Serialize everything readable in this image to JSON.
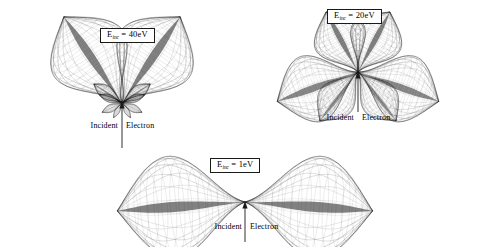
{
  "figure": {
    "background": "#ffffff",
    "ink": "#1a1a1a"
  },
  "chart_data": {
    "type": "line",
    "title": "",
    "xlabel": "",
    "ylabel": "",
    "plot_style": "polar wireframe surface of revolution",
    "panels": [
      {
        "id": "panel-40",
        "energy_label_prefix": "E",
        "energy_label_subscript": "inc",
        "energy_label_value": " = 40eV",
        "energy_ev": 40,
        "caption_left": "Incident",
        "caption_right": "Electron",
        "lobe_count": 10,
        "center_x": 122,
        "center_y": 103,
        "incident_arrow": {
          "from_y": 148,
          "to_y": 106
        },
        "lobes": [
          {
            "angle_deg": 124,
            "radius": 104,
            "width": 30,
            "weight": 1.0
          },
          {
            "angle_deg": 56,
            "radius": 104,
            "width": 30,
            "weight": 1.0
          },
          {
            "angle_deg": 146,
            "radius": 34,
            "width": 16,
            "weight": 0.75
          },
          {
            "angle_deg": 34,
            "radius": 34,
            "width": 16,
            "weight": 0.75
          },
          {
            "angle_deg": 160,
            "radius": 24,
            "width": 13,
            "weight": 0.6
          },
          {
            "angle_deg": 20,
            "radius": 24,
            "width": 13,
            "weight": 0.6
          },
          {
            "angle_deg": 205,
            "radius": 22,
            "width": 14,
            "weight": 0.55
          },
          {
            "angle_deg": 335,
            "radius": 22,
            "width": 14,
            "weight": 0.55
          },
          {
            "angle_deg": 240,
            "radius": 17,
            "width": 12,
            "weight": 0.45
          },
          {
            "angle_deg": 300,
            "radius": 17,
            "width": 12,
            "weight": 0.45
          }
        ]
      },
      {
        "id": "panel-20",
        "energy_label_prefix": "E",
        "energy_label_subscript": "inc",
        "energy_label_value": " = 20eV",
        "energy_ev": 20,
        "caption_left": "Incident",
        "caption_right": "Electron",
        "lobe_count": 6,
        "center_x": 106,
        "center_y": 72,
        "incident_arrow": {
          "from_y": 112,
          "to_y": 76
        },
        "lobes": [
          {
            "angle_deg": 118,
            "radius": 68,
            "width": 30,
            "weight": 1.0
          },
          {
            "angle_deg": 62,
            "radius": 68,
            "width": 30,
            "weight": 1.0
          },
          {
            "angle_deg": 200,
            "radius": 86,
            "width": 30,
            "weight": 0.95
          },
          {
            "angle_deg": 340,
            "radius": 86,
            "width": 30,
            "weight": 0.95
          },
          {
            "angle_deg": 232,
            "radius": 62,
            "width": 24,
            "weight": 0.8
          },
          {
            "angle_deg": 308,
            "radius": 62,
            "width": 24,
            "weight": 0.8
          }
        ]
      },
      {
        "id": "panel-1",
        "energy_label_prefix": "E",
        "energy_label_subscript": "inc",
        "energy_label_value": " = 1eV",
        "energy_ev": 1,
        "caption_left": "Incident",
        "caption_right": "Electron",
        "lobe_count": 2,
        "center_x": 155,
        "center_y": 52,
        "incident_arrow": {
          "from_y": 92,
          "to_y": 56
        },
        "lobes": [
          {
            "angle_deg": 184,
            "radius": 128,
            "width": 30,
            "weight": 1.0
          },
          {
            "angle_deg": 356,
            "radius": 128,
            "width": 30,
            "weight": 1.0
          }
        ]
      }
    ]
  }
}
